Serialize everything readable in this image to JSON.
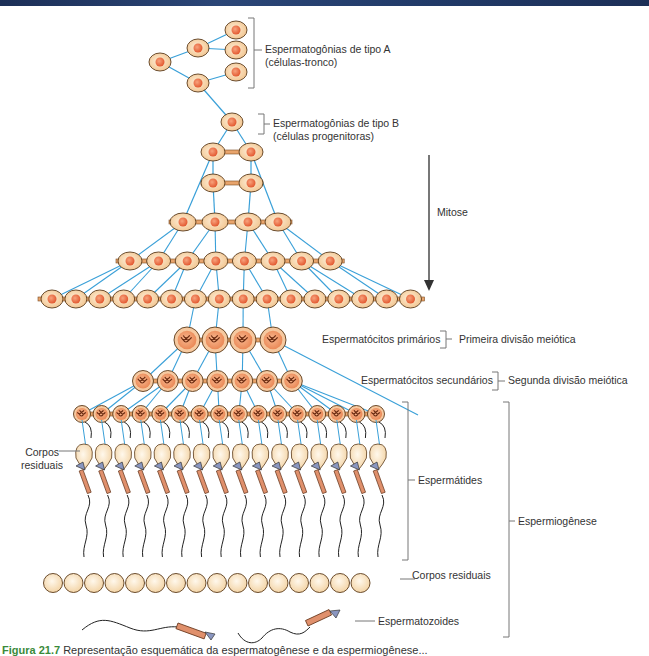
{
  "labels": {
    "type_a_line1": "Espermatogônias de tipo A",
    "type_a_line2": "(células-tronco)",
    "type_b_line1": "Espermatogônias de tipo B",
    "type_b_line2": "(células progenitoras)",
    "mitose": "Mitose",
    "primary": "Espermatócitos primários",
    "first_division": "Primeira divisão meiótica",
    "secondary": "Espermatócitos secundários",
    "second_division": "Segunda divisão meiótica",
    "residual_bodies_left_1": "Corpos",
    "residual_bodies_left_2": "residuais",
    "spermatids": "Espermátides",
    "spermiogenesis": "Espermiogênese",
    "residual_bodies": "Corpos residuais",
    "spermatozoa": "Espermatozoides"
  },
  "caption": {
    "figure": "Figura 21.7",
    "text": "Representação esquemática da espermatogênese e da espermiogênese..."
  },
  "colors": {
    "cell_fill": "#f6d3a8",
    "cell_stroke": "#5a3a1a",
    "nucleus": "#e8643c",
    "connector": "#3aa0d8",
    "bracket": "#666666",
    "top_band": "#1c2f57"
  }
}
